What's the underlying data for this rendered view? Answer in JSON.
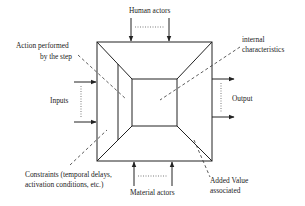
{
  "diagram": {
    "labels": {
      "human_actors": "Human actors",
      "material_actors": "Material actors",
      "inputs": "Inputs",
      "output": "Output",
      "action_line1": "Action performed",
      "action_line2": "by the step",
      "internal_line1": "internal",
      "internal_line2": "characteristics",
      "constraints_line1": "Constraints (temporal delays,",
      "constraints_line2": "activation conditions, etc.)",
      "added_value_line1": "Added Value",
      "added_value_line2": "associated"
    },
    "colors": {
      "stroke": "#222222",
      "background": "#ffffff"
    }
  }
}
